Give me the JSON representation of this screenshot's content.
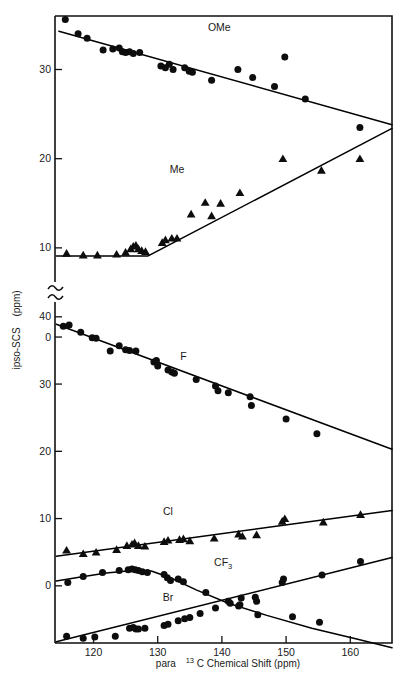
{
  "figure": {
    "background_color": "#ffffff",
    "ink_color": "#0d0d0d"
  },
  "axes": {
    "x_title_parts": {
      "pre": "para",
      "superscript": "13",
      "post": "C  Chemical Shift   (ppm)"
    },
    "y_title_parts": {
      "main": "ipso-SCS",
      "unit": "(ppm)"
    },
    "x_ticks": [
      "120",
      "130",
      "140",
      "150",
      "160"
    ],
    "x_tick_values": [
      120,
      130,
      140,
      150,
      160
    ],
    "x_range": [
      114.0,
      166.5
    ],
    "y_ticks_upper": [
      "30",
      "20",
      "10",
      "0"
    ],
    "y_ticks_lower": [
      "40",
      "30",
      "20",
      "10",
      "0"
    ],
    "axis_break": true,
    "axis_break_label": "y-axis break between 0 and 40"
  },
  "chart_data": {
    "type": "scatter",
    "title": "",
    "subtitle": "",
    "xlabel": "para 13C Chemical Shift (ppm)",
    "ylabel": "ipso-SCS (ppm)",
    "xlim": [
      114.0,
      166.5
    ],
    "grid": false,
    "legend": "inline-series-labels",
    "axis_break": {
      "present": true,
      "upper_panel_ylim": [
        5.5,
        36.0
      ],
      "lower_panel_ylim": [
        -8.5,
        42.5
      ]
    },
    "series": [
      {
        "name": "OMe",
        "label": "OMe",
        "marker": "circle",
        "panel": "upper",
        "label_x": 139.6,
        "label_y": 34.3,
        "fit": {
          "x": [
            114.6,
            166.5
          ],
          "y": [
            34.3,
            23.8
          ]
        },
        "points": [
          {
            "x": 115.6,
            "y": 35.6
          },
          {
            "x": 117.6,
            "y": 34.0
          },
          {
            "x": 119.0,
            "y": 33.5
          },
          {
            "x": 121.5,
            "y": 32.2
          },
          {
            "x": 123.0,
            "y": 32.3
          },
          {
            "x": 124.0,
            "y": 32.4
          },
          {
            "x": 124.5,
            "y": 32.0
          },
          {
            "x": 125.0,
            "y": 31.9
          },
          {
            "x": 125.6,
            "y": 32.0
          },
          {
            "x": 126.2,
            "y": 31.8
          },
          {
            "x": 127.2,
            "y": 31.9
          },
          {
            "x": 130.5,
            "y": 30.4
          },
          {
            "x": 131.2,
            "y": 30.2
          },
          {
            "x": 131.8,
            "y": 30.6
          },
          {
            "x": 132.4,
            "y": 30.0
          },
          {
            "x": 134.2,
            "y": 30.2
          },
          {
            "x": 134.9,
            "y": 29.8
          },
          {
            "x": 135.4,
            "y": 29.7
          },
          {
            "x": 138.4,
            "y": 28.8
          },
          {
            "x": 142.5,
            "y": 30.0
          },
          {
            "x": 144.8,
            "y": 29.1
          },
          {
            "x": 148.2,
            "y": 28.1
          },
          {
            "x": 149.8,
            "y": 31.4
          },
          {
            "x": 153.0,
            "y": 26.7
          },
          {
            "x": 161.5,
            "y": 23.5
          }
        ]
      },
      {
        "name": "Me",
        "label": "Me",
        "marker": "triangle",
        "panel": "upper",
        "label_x": 133.0,
        "label_y": 18.4,
        "fit": {
          "x": [
            114.2,
            128.5,
            166.5
          ],
          "y": [
            9.1,
            9.1,
            23.4
          ]
        },
        "points": [
          {
            "x": 115.8,
            "y": 9.4
          },
          {
            "x": 118.4,
            "y": 9.2
          },
          {
            "x": 120.6,
            "y": 9.2
          },
          {
            "x": 123.6,
            "y": 9.3
          },
          {
            "x": 125.0,
            "y": 9.5
          },
          {
            "x": 125.8,
            "y": 9.9
          },
          {
            "x": 126.2,
            "y": 10.2
          },
          {
            "x": 126.6,
            "y": 10.3
          },
          {
            "x": 127.0,
            "y": 9.9
          },
          {
            "x": 127.5,
            "y": 9.7
          },
          {
            "x": 128.1,
            "y": 9.6
          },
          {
            "x": 130.7,
            "y": 10.6
          },
          {
            "x": 131.2,
            "y": 10.9
          },
          {
            "x": 132.2,
            "y": 11.1
          },
          {
            "x": 133.0,
            "y": 11.1
          },
          {
            "x": 135.2,
            "y": 13.8
          },
          {
            "x": 137.4,
            "y": 15.1
          },
          {
            "x": 138.4,
            "y": 13.6
          },
          {
            "x": 139.8,
            "y": 15.0
          },
          {
            "x": 142.8,
            "y": 16.2
          },
          {
            "x": 149.5,
            "y": 20.0
          },
          {
            "x": 155.5,
            "y": 18.7
          },
          {
            "x": 161.5,
            "y": 20.0
          }
        ]
      },
      {
        "name": "CF3",
        "label": "CF3",
        "marker": "circle",
        "panel": "lower",
        "label_x": 140.2,
        "label_y": 3.0,
        "fit_curve": [
          {
            "x": 114.2,
            "y": 0.7
          },
          {
            "x": 118.0,
            "y": 1.3
          },
          {
            "x": 122.0,
            "y": 1.9
          },
          {
            "x": 126.0,
            "y": 2.3
          },
          {
            "x": 129.0,
            "y": 2.2
          },
          {
            "x": 132.0,
            "y": 1.2
          },
          {
            "x": 136.0,
            "y": -0.6
          },
          {
            "x": 141.0,
            "y": -2.6
          },
          {
            "x": 147.0,
            "y": -4.4
          },
          {
            "x": 154.0,
            "y": -6.3
          },
          {
            "x": 161.0,
            "y": -7.9
          },
          {
            "x": 166.5,
            "y": -9.2
          }
        ],
        "points": [
          {
            "x": 116.0,
            "y": 0.5
          },
          {
            "x": 118.4,
            "y": 1.4
          },
          {
            "x": 121.4,
            "y": 2.0
          },
          {
            "x": 124.0,
            "y": 2.3
          },
          {
            "x": 125.4,
            "y": 2.4
          },
          {
            "x": 126.0,
            "y": 2.5
          },
          {
            "x": 126.5,
            "y": 2.4
          },
          {
            "x": 127.0,
            "y": 2.3
          },
          {
            "x": 127.6,
            "y": 2.1
          },
          {
            "x": 128.4,
            "y": 2.0
          },
          {
            "x": 131.0,
            "y": 1.7
          },
          {
            "x": 131.5,
            "y": 1.2
          },
          {
            "x": 132.0,
            "y": 0.8
          },
          {
            "x": 133.2,
            "y": 1.0
          },
          {
            "x": 134.0,
            "y": 0.6
          },
          {
            "x": 137.5,
            "y": -1.0
          },
          {
            "x": 141.0,
            "y": -2.3
          },
          {
            "x": 141.3,
            "y": -2.6
          },
          {
            "x": 142.8,
            "y": -2.8
          },
          {
            "x": 145.4,
            "y": -2.3
          },
          {
            "x": 145.6,
            "y": -4.3
          },
          {
            "x": 151.0,
            "y": -4.6
          },
          {
            "x": 155.2,
            "y": -5.4
          }
        ]
      },
      {
        "name": "F",
        "label": "F",
        "marker": "circle",
        "panel": "lower",
        "label_x": 134.0,
        "label_y": 33.6,
        "fit": {
          "x": [
            114.2,
            166.5
          ],
          "y": [
            38.9,
            20.3
          ]
        },
        "points": [
          {
            "x": 115.3,
            "y": 38.6
          },
          {
            "x": 116.2,
            "y": 38.8
          },
          {
            "x": 118.0,
            "y": 37.7
          },
          {
            "x": 119.8,
            "y": 36.9
          },
          {
            "x": 120.4,
            "y": 36.8
          },
          {
            "x": 122.6,
            "y": 34.9
          },
          {
            "x": 124.0,
            "y": 35.7
          },
          {
            "x": 125.0,
            "y": 35.1
          },
          {
            "x": 125.6,
            "y": 35.0
          },
          {
            "x": 126.6,
            "y": 34.9
          },
          {
            "x": 129.4,
            "y": 33.3
          },
          {
            "x": 129.8,
            "y": 33.5
          },
          {
            "x": 130.0,
            "y": 32.7
          },
          {
            "x": 131.6,
            "y": 32.1
          },
          {
            "x": 132.2,
            "y": 31.8
          },
          {
            "x": 132.6,
            "y": 31.6
          },
          {
            "x": 136.0,
            "y": 30.7
          },
          {
            "x": 139.0,
            "y": 29.7
          },
          {
            "x": 139.4,
            "y": 29.0
          },
          {
            "x": 141.0,
            "y": 28.7
          },
          {
            "x": 144.4,
            "y": 28.1
          },
          {
            "x": 144.6,
            "y": 26.8
          },
          {
            "x": 150.0,
            "y": 24.8
          },
          {
            "x": 154.8,
            "y": 22.6
          }
        ]
      },
      {
        "name": "Cl",
        "label": "Cl",
        "marker": "triangle",
        "panel": "lower",
        "label_x": 131.6,
        "label_y": 10.5,
        "fit": {
          "x": [
            114.2,
            166.5
          ],
          "y": [
            4.4,
            11.2
          ]
        },
        "points": [
          {
            "x": 115.8,
            "y": 5.3
          },
          {
            "x": 118.4,
            "y": 4.8
          },
          {
            "x": 120.4,
            "y": 5.0
          },
          {
            "x": 123.6,
            "y": 5.4
          },
          {
            "x": 125.2,
            "y": 6.0
          },
          {
            "x": 126.0,
            "y": 6.2
          },
          {
            "x": 126.4,
            "y": 6.4
          },
          {
            "x": 127.0,
            "y": 6.0
          },
          {
            "x": 128.0,
            "y": 5.9
          },
          {
            "x": 131.0,
            "y": 6.6
          },
          {
            "x": 131.6,
            "y": 6.8
          },
          {
            "x": 133.4,
            "y": 6.9
          },
          {
            "x": 134.0,
            "y": 7.0
          },
          {
            "x": 135.0,
            "y": 6.7
          },
          {
            "x": 138.8,
            "y": 7.1
          },
          {
            "x": 142.6,
            "y": 7.7
          },
          {
            "x": 143.2,
            "y": 7.4
          },
          {
            "x": 145.4,
            "y": 7.6
          },
          {
            "x": 149.4,
            "y": 9.6
          },
          {
            "x": 149.8,
            "y": 10.0
          },
          {
            "x": 155.8,
            "y": 9.5
          },
          {
            "x": 161.6,
            "y": 10.6
          }
        ]
      },
      {
        "name": "Br",
        "label": "Br",
        "marker": "circle",
        "panel": "lower",
        "label_x": 131.6,
        "label_y": -2.3,
        "fit": {
          "x": [
            114.2,
            166.5
          ],
          "y": [
            -8.3,
            4.2
          ]
        },
        "points": [
          {
            "x": 115.8,
            "y": -7.5
          },
          {
            "x": 118.4,
            "y": -7.8
          },
          {
            "x": 120.2,
            "y": -7.6
          },
          {
            "x": 123.4,
            "y": -7.5
          },
          {
            "x": 125.6,
            "y": -6.3
          },
          {
            "x": 126.2,
            "y": -6.2
          },
          {
            "x": 126.6,
            "y": -6.4
          },
          {
            "x": 127.0,
            "y": -6.4
          },
          {
            "x": 128.0,
            "y": -6.3
          },
          {
            "x": 131.0,
            "y": -5.9
          },
          {
            "x": 131.6,
            "y": -5.7
          },
          {
            "x": 133.2,
            "y": -5.2
          },
          {
            "x": 134.2,
            "y": -4.9
          },
          {
            "x": 135.0,
            "y": -4.7
          },
          {
            "x": 136.6,
            "y": -4.1
          },
          {
            "x": 139.0,
            "y": -3.3
          },
          {
            "x": 142.6,
            "y": -3.0
          },
          {
            "x": 143.0,
            "y": -1.8
          },
          {
            "x": 145.2,
            "y": -1.7
          },
          {
            "x": 149.4,
            "y": 0.5
          },
          {
            "x": 149.6,
            "y": 1.0
          },
          {
            "x": 155.6,
            "y": 1.6
          },
          {
            "x": 161.6,
            "y": 3.6
          }
        ]
      }
    ]
  }
}
